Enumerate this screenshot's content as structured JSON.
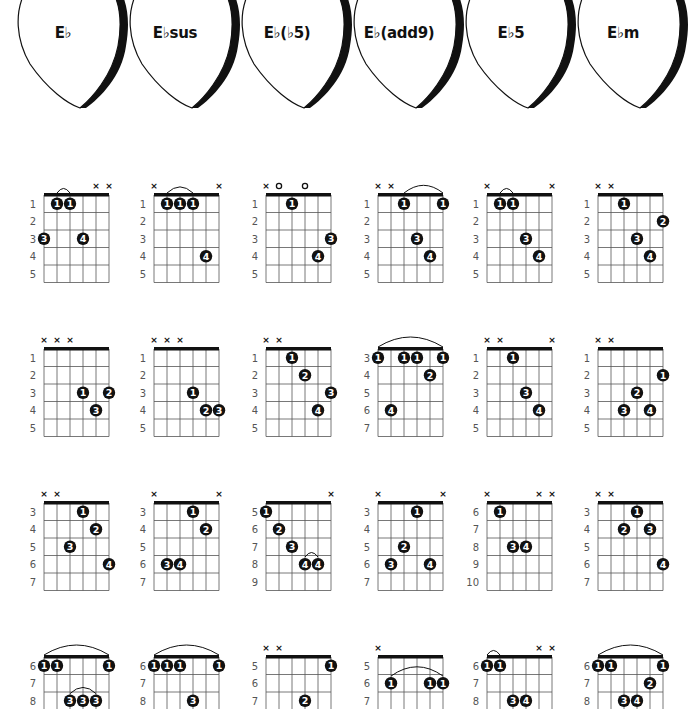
{
  "colors": {
    "ink": "#111111",
    "grid": "#555555",
    "fret_number": "#555555",
    "background": "#ffffff"
  },
  "picks": [
    {
      "label": "E♭"
    },
    {
      "label": "E♭sus"
    },
    {
      "label": "E♭(♭5)"
    },
    {
      "label": "E♭(add9)"
    },
    {
      "label": "E♭5"
    },
    {
      "label": "E♭m"
    }
  ],
  "columns": [
    "E♭",
    "E♭sus",
    "E♭(♭5)",
    "E♭(add9)",
    "E♭5",
    "E♭m"
  ],
  "rows": [
    [
      {
        "frets": [
          1,
          2,
          3,
          4,
          5
        ],
        "marks": [
          "",
          "",
          "",
          "",
          "x",
          "x"
        ],
        "dots": [
          {
            "s": 1,
            "f": 1,
            "n": "1"
          },
          {
            "s": 2,
            "f": 1,
            "n": "1"
          },
          {
            "s": 0,
            "f": 3,
            "n": "3"
          },
          {
            "s": 3,
            "f": 3,
            "n": "4"
          }
        ],
        "arcs": [
          {
            "from": 1,
            "to": 2,
            "f": 1
          }
        ],
        "notes": "G  B♭  E♭  B♭"
      },
      {
        "frets": [
          1,
          2,
          3,
          4,
          5
        ],
        "marks": [
          "x",
          "",
          "",
          "",
          "",
          "x"
        ],
        "dots": [
          {
            "s": 1,
            "f": 1,
            "n": "1"
          },
          {
            "s": 2,
            "f": 1,
            "n": "1"
          },
          {
            "s": 3,
            "f": 1,
            "n": "1"
          },
          {
            "s": 4,
            "f": 4,
            "n": "4"
          }
        ],
        "arcs": [
          {
            "from": 1,
            "to": 3,
            "f": 1
          }
        ],
        "notes": "B♭  E♭  A♭  E♭"
      },
      {
        "frets": [
          1,
          2,
          3,
          4,
          5
        ],
        "marks": [
          "x",
          "o",
          "",
          "o",
          "",
          ""
        ],
        "dots": [
          {
            "s": 2,
            "f": 1,
            "n": "1"
          },
          {
            "s": 5,
            "f": 3,
            "n": "3"
          },
          {
            "s": 4,
            "f": 4,
            "n": "4"
          }
        ],
        "arcs": [],
        "notes": "B♭♭ E♭  G  E♭  G"
      },
      {
        "frets": [
          1,
          2,
          3,
          4,
          5
        ],
        "marks": [
          "x",
          "x",
          "",
          "",
          "",
          ""
        ],
        "dots": [
          {
            "s": 2,
            "f": 1,
            "n": "1"
          },
          {
            "s": 5,
            "f": 1,
            "n": "1"
          },
          {
            "s": 3,
            "f": 3,
            "n": "3"
          },
          {
            "s": 4,
            "f": 4,
            "n": "4"
          }
        ],
        "arcs": [
          {
            "from": 2,
            "to": 5,
            "f": 1
          }
        ],
        "notes": "E♭  B♭  E♭  F"
      },
      {
        "frets": [
          1,
          2,
          3,
          4,
          5
        ],
        "marks": [
          "x",
          "",
          "",
          "",
          "",
          "x"
        ],
        "dots": [
          {
            "s": 1,
            "f": 1,
            "n": "1"
          },
          {
            "s": 2,
            "f": 1,
            "n": "1"
          },
          {
            "s": 3,
            "f": 3,
            "n": "3"
          },
          {
            "s": 4,
            "f": 4,
            "n": "4"
          }
        ],
        "arcs": [
          {
            "from": 1,
            "to": 2,
            "f": 1
          }
        ],
        "notes": "B♭  E♭  B♭  E♭"
      },
      {
        "frets": [
          1,
          2,
          3,
          4,
          5
        ],
        "marks": [
          "x",
          "x",
          "",
          "",
          "",
          ""
        ],
        "dots": [
          {
            "s": 2,
            "f": 1,
            "n": "1"
          },
          {
            "s": 5,
            "f": 2,
            "n": "2"
          },
          {
            "s": 3,
            "f": 3,
            "n": "3"
          },
          {
            "s": 4,
            "f": 4,
            "n": "4"
          }
        ],
        "arcs": [],
        "notes": "E♭  B♭  E♭  G♭"
      }
    ],
    [
      {
        "frets": [
          1,
          2,
          3,
          4,
          5
        ],
        "marks": [
          "x",
          "x",
          "x",
          "",
          "",
          ""
        ],
        "dots": [
          {
            "s": 3,
            "f": 3,
            "n": "1"
          },
          {
            "s": 5,
            "f": 3,
            "n": "2"
          },
          {
            "s": 4,
            "f": 4,
            "n": "3"
          }
        ],
        "arcs": [],
        "notes": "B♭  E♭  G"
      },
      {
        "frets": [
          1,
          2,
          3,
          4,
          5
        ],
        "marks": [
          "x",
          "x",
          "x",
          "",
          "",
          ""
        ],
        "dots": [
          {
            "s": 3,
            "f": 3,
            "n": "1"
          },
          {
            "s": 4,
            "f": 4,
            "n": "2"
          },
          {
            "s": 5,
            "f": 4,
            "n": "3"
          }
        ],
        "arcs": [],
        "notes": "B♭  E♭  A♭"
      },
      {
        "frets": [
          1,
          2,
          3,
          4,
          5
        ],
        "marks": [
          "x",
          "x",
          "",
          "",
          "",
          ""
        ],
        "dots": [
          {
            "s": 2,
            "f": 1,
            "n": "1"
          },
          {
            "s": 3,
            "f": 2,
            "n": "2"
          },
          {
            "s": 5,
            "f": 3,
            "n": "3"
          },
          {
            "s": 4,
            "f": 4,
            "n": "4"
          }
        ],
        "arcs": [],
        "notes": "E♭  B♭♭ E♭  G"
      },
      {
        "frets": [
          3,
          4,
          5,
          6,
          7
        ],
        "marks": [
          "",
          "",
          "",
          "",
          "",
          ""
        ],
        "dots": [
          {
            "s": 0,
            "f": 1,
            "n": "1"
          },
          {
            "s": 2,
            "f": 1,
            "n": "1"
          },
          {
            "s": 3,
            "f": 1,
            "n": "1"
          },
          {
            "s": 5,
            "f": 1,
            "n": "1"
          },
          {
            "s": 4,
            "f": 2,
            "n": "2"
          },
          {
            "s": 1,
            "f": 4,
            "n": "4"
          }
        ],
        "arcs": [
          {
            "from": 0,
            "to": 5,
            "f": 1
          }
        ],
        "notes": "G  E♭  F  B♭  E♭  G"
      },
      {
        "frets": [
          1,
          2,
          3,
          4,
          5
        ],
        "marks": [
          "x",
          "x",
          "",
          "",
          "",
          "x"
        ],
        "dots": [
          {
            "s": 2,
            "f": 1,
            "n": "1"
          },
          {
            "s": 3,
            "f": 3,
            "n": "3"
          },
          {
            "s": 4,
            "f": 4,
            "n": "4"
          }
        ],
        "arcs": [],
        "notes": "E♭  B♭  E♭"
      },
      {
        "frets": [
          1,
          2,
          3,
          4,
          5
        ],
        "marks": [
          "x",
          "x",
          "",
          "",
          "",
          ""
        ],
        "dots": [
          {
            "s": 5,
            "f": 2,
            "n": "1"
          },
          {
            "s": 3,
            "f": 3,
            "n": "2"
          },
          {
            "s": 2,
            "f": 4,
            "n": "3"
          },
          {
            "s": 4,
            "f": 4,
            "n": "4"
          }
        ],
        "arcs": [],
        "notes": "G♭  B♭  E♭  G♭"
      }
    ],
    [
      {
        "frets": [
          3,
          4,
          5,
          6,
          7
        ],
        "marks": [
          "x",
          "x",
          "",
          "",
          "",
          ""
        ],
        "dots": [
          {
            "s": 3,
            "f": 1,
            "n": "1"
          },
          {
            "s": 4,
            "f": 2,
            "n": "2"
          },
          {
            "s": 2,
            "f": 3,
            "n": "3"
          },
          {
            "s": 5,
            "f": 4,
            "n": "4"
          }
        ],
        "arcs": [],
        "notes": "G  B♭  E♭  B♭"
      },
      {
        "frets": [
          3,
          4,
          5,
          6,
          7
        ],
        "marks": [
          "x",
          "",
          "",
          "",
          "",
          "x"
        ],
        "dots": [
          {
            "s": 3,
            "f": 1,
            "n": "1"
          },
          {
            "s": 4,
            "f": 2,
            "n": "2"
          },
          {
            "s": 1,
            "f": 4,
            "n": "3"
          },
          {
            "s": 2,
            "f": 4,
            "n": "4"
          }
        ],
        "arcs": [],
        "notes": "E♭  A♭  B♭  E♭"
      },
      {
        "frets": [
          5,
          6,
          7,
          8,
          9
        ],
        "marks": [
          "",
          "",
          "",
          "",
          "",
          "x"
        ],
        "dots": [
          {
            "s": 0,
            "f": 1,
            "n": "1"
          },
          {
            "s": 1,
            "f": 2,
            "n": "2"
          },
          {
            "s": 2,
            "f": 3,
            "n": "3"
          },
          {
            "s": 3,
            "f": 4,
            "n": "4"
          },
          {
            "s": 4,
            "f": 4,
            "n": "4"
          }
        ],
        "arcs": [
          {
            "from": 3,
            "to": 4,
            "f": 4
          }
        ],
        "notes": "B♭♭ E♭ B♭♭ E♭  G"
      },
      {
        "frets": [
          3,
          4,
          5,
          6,
          7
        ],
        "marks": [
          "x",
          "",
          "",
          "",
          "",
          "x"
        ],
        "dots": [
          {
            "s": 3,
            "f": 1,
            "n": "1"
          },
          {
            "s": 2,
            "f": 3,
            "n": "2"
          },
          {
            "s": 1,
            "f": 4,
            "n": "3"
          },
          {
            "s": 4,
            "f": 4,
            "n": "4"
          }
        ],
        "arcs": [],
        "notes": "E♭  G  B♭  F"
      },
      {
        "frets": [
          6,
          7,
          8,
          9,
          10
        ],
        "marks": [
          "x",
          "",
          "",
          "",
          "x",
          "x"
        ],
        "dots": [
          {
            "s": 1,
            "f": 1,
            "n": "1"
          },
          {
            "s": 2,
            "f": 3,
            "n": "3"
          },
          {
            "s": 3,
            "f": 3,
            "n": "4"
          }
        ],
        "arcs": [],
        "notes": "E♭  B♭  E♭"
      },
      {
        "frets": [
          3,
          4,
          5,
          6,
          7
        ],
        "marks": [
          "x",
          "x",
          "",
          "",
          "",
          ""
        ],
        "dots": [
          {
            "s": 3,
            "f": 1,
            "n": "1"
          },
          {
            "s": 2,
            "f": 2,
            "n": "2"
          },
          {
            "s": 4,
            "f": 2,
            "n": "3"
          },
          {
            "s": 5,
            "f": 4,
            "n": "4"
          }
        ],
        "arcs": [],
        "notes": "G♭  B♭  E♭  B♭"
      }
    ],
    [
      {
        "frets": [
          6,
          7,
          8,
          9,
          10
        ],
        "marks": [
          "",
          "",
          "",
          "",
          "",
          ""
        ],
        "dots": [
          {
            "s": 0,
            "f": 1,
            "n": "1"
          },
          {
            "s": 1,
            "f": 1,
            "n": "1"
          },
          {
            "s": 5,
            "f": 1,
            "n": "1"
          },
          {
            "s": 2,
            "f": 3,
            "n": "3"
          },
          {
            "s": 3,
            "f": 3,
            "n": "3"
          },
          {
            "s": 4,
            "f": 3,
            "n": "3"
          }
        ],
        "arcs": [
          {
            "from": 0,
            "to": 5,
            "f": 1
          },
          {
            "from": 2,
            "to": 4,
            "f": 3
          }
        ],
        "notes": ""
      },
      {
        "frets": [
          6,
          7,
          8,
          9,
          10
        ],
        "marks": [
          "",
          "",
          "",
          "",
          "",
          ""
        ],
        "dots": [
          {
            "s": 0,
            "f": 1,
            "n": "1"
          },
          {
            "s": 1,
            "f": 1,
            "n": "1"
          },
          {
            "s": 2,
            "f": 1,
            "n": "1"
          },
          {
            "s": 5,
            "f": 1,
            "n": "1"
          },
          {
            "s": 3,
            "f": 3,
            "n": "3"
          }
        ],
        "arcs": [
          {
            "from": 0,
            "to": 5,
            "f": 1
          }
        ],
        "notes": ""
      },
      {
        "frets": [
          5,
          6,
          7,
          8,
          9
        ],
        "marks": [
          "x",
          "x",
          "",
          "",
          "",
          ""
        ],
        "dots": [
          {
            "s": 5,
            "f": 1,
            "n": "1"
          },
          {
            "s": 3,
            "f": 3,
            "n": "2"
          }
        ],
        "arcs": [],
        "notes": ""
      },
      {
        "frets": [
          5,
          6,
          7,
          8,
          9
        ],
        "marks": [
          "x",
          "",
          "",
          "",
          "",
          ""
        ],
        "dots": [
          {
            "s": 1,
            "f": 2,
            "n": "1"
          },
          {
            "s": 4,
            "f": 2,
            "n": "1"
          },
          {
            "s": 5,
            "f": 2,
            "n": "1"
          }
        ],
        "arcs": [
          {
            "from": 1,
            "to": 5,
            "f": 2
          }
        ],
        "notes": ""
      },
      {
        "frets": [
          6,
          7,
          8,
          9,
          10
        ],
        "marks": [
          "",
          "",
          "",
          "",
          "x",
          "x"
        ],
        "dots": [
          {
            "s": 0,
            "f": 1,
            "n": "1"
          },
          {
            "s": 1,
            "f": 1,
            "n": "1"
          },
          {
            "s": 2,
            "f": 3,
            "n": "3"
          },
          {
            "s": 3,
            "f": 3,
            "n": "4"
          }
        ],
        "arcs": [
          {
            "from": 0,
            "to": 1,
            "f": 1
          }
        ],
        "notes": ""
      },
      {
        "frets": [
          6,
          7,
          8,
          9,
          10
        ],
        "marks": [
          "",
          "",
          "",
          "",
          "",
          ""
        ],
        "dots": [
          {
            "s": 0,
            "f": 1,
            "n": "1"
          },
          {
            "s": 1,
            "f": 1,
            "n": "1"
          },
          {
            "s": 5,
            "f": 1,
            "n": "1"
          },
          {
            "s": 4,
            "f": 2,
            "n": "2"
          },
          {
            "s": 2,
            "f": 3,
            "n": "3"
          },
          {
            "s": 3,
            "f": 3,
            "n": "4"
          }
        ],
        "arcs": [
          {
            "from": 0,
            "to": 5,
            "f": 1
          }
        ],
        "notes": ""
      }
    ]
  ]
}
